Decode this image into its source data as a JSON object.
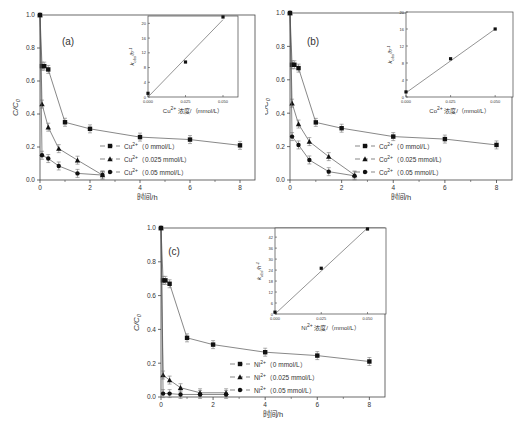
{
  "figure": {
    "panels": [
      "a",
      "b",
      "c"
    ]
  },
  "chart_data": [
    {
      "type": "line",
      "panel_label": "(a)",
      "xlabel": "时间/h",
      "ylabel": "C/C0",
      "xlim": [
        0,
        8.6
      ],
      "ylim": [
        0,
        1.0
      ],
      "xticks": [
        0,
        2,
        4,
        6,
        8
      ],
      "yticks": [
        0.0,
        0.2,
        0.4,
        0.6,
        0.8,
        1.0
      ],
      "legend_position": "lower-right",
      "series": [
        {
          "name": "Cu2+ (0 mmol/L)",
          "ion": "Cu",
          "conc": "0 mmol/L",
          "marker": "square",
          "x": [
            0,
            0.08,
            0.17,
            0.33,
            1,
            2,
            4,
            6,
            8
          ],
          "y": [
            1.0,
            0.69,
            0.69,
            0.67,
            0.35,
            0.31,
            0.26,
            0.245,
            0.21
          ]
        },
        {
          "name": "Cu2+ (0.025 mmol/L)",
          "ion": "Cu",
          "conc": "0.025 mmol/L",
          "marker": "triangle",
          "x": [
            0,
            0.08,
            0.33,
            0.75,
            1.5,
            2.5
          ],
          "y": [
            1.0,
            0.46,
            0.32,
            0.19,
            0.12,
            0.03
          ]
        },
        {
          "name": "Cu2+ (0.05 mmol/L)",
          "ion": "Cu",
          "conc": "0.05 mmol/L",
          "marker": "circle",
          "x": [
            0,
            0.08,
            0.33,
            0.75,
            1.5,
            2.5
          ],
          "y": [
            1.0,
            0.15,
            0.13,
            0.085,
            0.04,
            0.03
          ]
        }
      ],
      "inset": {
        "type": "scatter",
        "xlabel": "Cu2+ 浓度/（mmol/L）",
        "ylabel": "k_obs/h-1",
        "xlim": [
          0,
          0.06
        ],
        "ylim": [
          0,
          22
        ],
        "xticks": [
          "0.000",
          "0.025",
          "0.050"
        ],
        "yticks": [
          0,
          4,
          8,
          12,
          16,
          20
        ],
        "x": [
          0,
          0.025,
          0.05
        ],
        "y": [
          1.0,
          9.5,
          22
        ],
        "fit_line": [
          [
            0,
            0
          ],
          [
            0.05,
            21
          ]
        ]
      }
    },
    {
      "type": "line",
      "panel_label": "(b)",
      "xlabel": "时间/h",
      "ylabel": "C/C0",
      "xlim": [
        0,
        8.6
      ],
      "ylim": [
        0,
        1.0
      ],
      "xticks": [
        0,
        2,
        4,
        6,
        8
      ],
      "yticks": [
        0.0,
        0.2,
        0.4,
        0.6,
        0.8,
        1.0
      ],
      "legend_position": "lower-right",
      "series": [
        {
          "name": "Co2+ (0 mmol/L)",
          "ion": "Co",
          "conc": "0 mmol/L",
          "marker": "square",
          "x": [
            0,
            0.08,
            0.17,
            0.33,
            1,
            2,
            4,
            6,
            8
          ],
          "y": [
            1.0,
            0.69,
            0.69,
            0.67,
            0.345,
            0.31,
            0.26,
            0.245,
            0.21
          ]
        },
        {
          "name": "Co2+ (0.025 mmol/L)",
          "ion": "Co",
          "conc": "0.025 mmol/L",
          "marker": "triangle",
          "x": [
            0,
            0.08,
            0.33,
            0.75,
            1.5,
            2.5
          ],
          "y": [
            1.0,
            0.46,
            0.335,
            0.23,
            0.14,
            0.03
          ]
        },
        {
          "name": "Co2+ (0.05 mmol/L)",
          "ion": "Co",
          "conc": "0.05 mmol/L",
          "marker": "circle",
          "x": [
            0,
            0.08,
            0.33,
            0.75,
            1.5,
            2.5
          ],
          "y": [
            1.0,
            0.26,
            0.21,
            0.12,
            0.05,
            0.025
          ]
        }
      ],
      "inset": {
        "type": "scatter",
        "xlabel": "Co2+ 浓度/（mmol/L）",
        "ylabel": "k_obs/h-1",
        "xlim": [
          0,
          0.06
        ],
        "ylim": [
          0,
          20
        ],
        "xticks": [
          "0.000",
          "0.025",
          "0.050"
        ],
        "yticks": [
          0,
          4,
          8,
          12,
          16,
          20
        ],
        "x": [
          0,
          0.025,
          0.05
        ],
        "y": [
          1.2,
          9.0,
          16.0
        ],
        "fit_line": [
          [
            0,
            1.0
          ],
          [
            0.05,
            16.0
          ]
        ]
      }
    },
    {
      "type": "line",
      "panel_label": "(c)",
      "xlabel": "时间/h",
      "ylabel": "C/C0",
      "xlim": [
        0,
        8.6
      ],
      "ylim": [
        0,
        1.0
      ],
      "xticks": [
        0,
        2,
        4,
        6,
        8
      ],
      "yticks": [
        0.0,
        0.2,
        0.4,
        0.6,
        0.8,
        1.0
      ],
      "legend_position": "lower-right",
      "series": [
        {
          "name": "Ni2+ (0 mmol/L)",
          "ion": "Ni",
          "conc": "0 mmol/L",
          "marker": "square",
          "x": [
            0,
            0.08,
            0.17,
            0.33,
            1,
            2,
            4,
            6,
            8
          ],
          "y": [
            1.0,
            0.69,
            0.69,
            0.67,
            0.35,
            0.31,
            0.265,
            0.245,
            0.21
          ]
        },
        {
          "name": "Ni2+ (0.025 mmol/L)",
          "ion": "Ni",
          "conc": "0.025 mmol/L",
          "marker": "triangle",
          "x": [
            0,
            0.08,
            0.33,
            0.75,
            1.5,
            2.5
          ],
          "y": [
            1.0,
            0.13,
            0.1,
            0.055,
            0.025,
            0.025
          ]
        },
        {
          "name": "Ni2+ (0.05 mmol/L)",
          "ion": "Ni",
          "conc": "0.05 mmol/L",
          "marker": "circle",
          "x": [
            0,
            0.08,
            0.33,
            0.75,
            1.5,
            2.5
          ],
          "y": [
            1.0,
            0.02,
            0.02,
            0.015,
            0.015,
            0.015
          ]
        }
      ],
      "inset": {
        "type": "scatter",
        "xlabel": "Ni2+ 浓度/（mmol/L）",
        "ylabel": "k_obs/h-1",
        "xlim": [
          0,
          0.06
        ],
        "ylim": [
          0,
          47
        ],
        "xticks": [
          "0.000",
          "0.025",
          "0.050"
        ],
        "yticks": [
          0,
          6,
          12,
          18,
          24,
          30,
          36,
          42
        ],
        "x": [
          0,
          0.025,
          0.05
        ],
        "y": [
          1.0,
          25.0,
          47.0
        ],
        "fit_line": [
          [
            0,
            0
          ],
          [
            0.05,
            47
          ]
        ]
      }
    }
  ],
  "layout_px": [
    {
      "left": 0,
      "top": 0,
      "width": 265,
      "height": 200,
      "plot": {
        "x0": 40,
        "x1": 255,
        "y0": 15,
        "y1": 180
      },
      "inset": {
        "x0": 148,
        "x1": 238,
        "y0": 16,
        "y1": 97
      },
      "label_pos": [
        68,
        45
      ],
      "legend": {
        "x": 118,
        "y": 146,
        "dy": 13
      }
    },
    {
      "left": 265,
      "top": 0,
      "width": 261,
      "height": 200,
      "plot": {
        "x0": 25,
        "x1": 247,
        "y0": 13,
        "y1": 180
      },
      "inset": {
        "x0": 141,
        "x1": 248,
        "y0": 12,
        "y1": 97
      },
      "label_pos": [
        48,
        45
      ],
      "legend": {
        "x": 108,
        "y": 146,
        "dy": 13
      }
    },
    {
      "left": 130,
      "top": 220,
      "width": 270,
      "height": 200,
      "plot": {
        "x0": 31,
        "x1": 255,
        "y0": 8,
        "y1": 177
      },
      "inset": {
        "x0": 145,
        "x1": 256,
        "y0": 8,
        "y1": 94
      },
      "label_pos": [
        44,
        35
      ],
      "legend": {
        "x": 118,
        "y": 144,
        "dy": 13
      }
    }
  ],
  "caption": ""
}
